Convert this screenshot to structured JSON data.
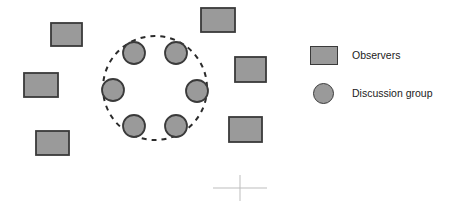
{
  "diagram": {
    "type": "seating-layout-diagram",
    "canvas": {
      "width": 455,
      "height": 205
    },
    "colors": {
      "shape_fill": "#9a9a9a",
      "shape_stroke": "#3a3a3a",
      "boundary_stroke": "#2b2b2b",
      "background": "#ffffff",
      "crosshair": "#bdbdbd",
      "text": "#1b1b1b"
    },
    "boundary": {
      "name": "discussion-circle-boundary",
      "shape": "circle",
      "style": "dashed",
      "cx": 155,
      "cy": 88,
      "r": 52,
      "stroke_width": 2,
      "dash_pattern": "5 5"
    },
    "discussion_group": {
      "label": "Discussion group",
      "count": 6,
      "radius": 11,
      "members": [
        {
          "id": 1,
          "cx": 134,
          "cy": 53
        },
        {
          "id": 2,
          "cx": 176,
          "cy": 53
        },
        {
          "id": 3,
          "cx": 113,
          "cy": 90
        },
        {
          "id": 4,
          "cx": 197,
          "cy": 91
        },
        {
          "id": 5,
          "cx": 134,
          "cy": 126
        },
        {
          "id": 6,
          "cx": 176,
          "cy": 126
        }
      ]
    },
    "observers": {
      "label": "Observers",
      "count": 6,
      "seats": [
        {
          "id": 1,
          "x": 51,
          "y": 23,
          "width": 31,
          "height": 23
        },
        {
          "id": 2,
          "x": 201,
          "y": 8,
          "width": 34,
          "height": 24
        },
        {
          "id": 3,
          "x": 24,
          "y": 73,
          "width": 34,
          "height": 24
        },
        {
          "id": 4,
          "x": 235,
          "y": 57,
          "width": 31,
          "height": 25
        },
        {
          "id": 5,
          "x": 36,
          "y": 131,
          "width": 33,
          "height": 24
        },
        {
          "id": 6,
          "x": 229,
          "y": 117,
          "width": 33,
          "height": 25
        }
      ]
    },
    "crosshair": {
      "name": "registration-crosshair",
      "cx": 240,
      "cy": 188,
      "half_width": 27,
      "half_height": 13
    }
  },
  "legend": {
    "items": [
      {
        "key": "observers",
        "label": "Observers",
        "marker": "rectangle"
      },
      {
        "key": "discussion",
        "label": "Discussion group",
        "marker": "circle"
      }
    ]
  }
}
